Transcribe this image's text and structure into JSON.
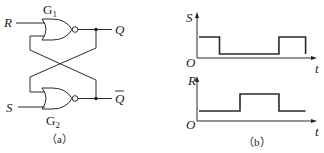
{
  "figure_a": {
    "caption": "（a）",
    "gates": [
      {
        "name": "G",
        "subscript": "1",
        "type": "NOR"
      },
      {
        "name": "G",
        "subscript": "2",
        "type": "NOR"
      }
    ],
    "inputs": {
      "top": "R",
      "bottom": "S"
    },
    "outputs": {
      "top": "Q",
      "bottom": "Q"
    },
    "bottom_output_overbar": true
  },
  "figure_b": {
    "caption": "（b）",
    "plots": [
      {
        "ylabel": "S",
        "xlabel": "t",
        "origin_label": "O",
        "levels": [
          1,
          0,
          0,
          1,
          0
        ],
        "segment_edges": [
          0,
          1,
          2.8,
          3.9,
          5.2
        ]
      },
      {
        "ylabel": "R",
        "xlabel": "t",
        "origin_label": "O",
        "levels": [
          0,
          1,
          0
        ],
        "segment_edges": [
          0,
          2,
          3.9,
          5.2
        ]
      }
    ]
  }
}
